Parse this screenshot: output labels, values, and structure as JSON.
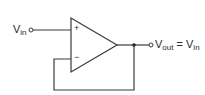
{
  "diagram": {
    "title": "",
    "type": "op-amp voltage follower",
    "input_label": {
      "main": "V",
      "sub": "in"
    },
    "output_label": {
      "main": "V",
      "sub": "out",
      "eq": " = ",
      "rhs_main": "V",
      "rhs_sub": "in"
    },
    "noninverting_sign": "+",
    "inverting_sign": "−",
    "colors": {
      "line": "#3a3a3a",
      "background": "#ffffff"
    }
  }
}
